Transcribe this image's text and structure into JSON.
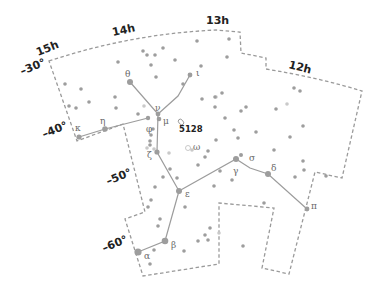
{
  "colors": {
    "boundary": "#9a9a9a",
    "star": "#9d9d9d",
    "line": "#9c9c9c",
    "label": "#222222"
  },
  "ra_labels": [
    {
      "text": "15h",
      "x": 38,
      "y": 56,
      "rot": -22
    },
    {
      "text": "14h",
      "x": 113,
      "y": 36,
      "rot": -12
    },
    {
      "text": "13h",
      "x": 206,
      "y": 24,
      "rot": 0
    },
    {
      "text": "12h",
      "x": 288,
      "y": 68,
      "rot": 14
    }
  ],
  "dec_labels": [
    {
      "text": "–30°",
      "x": 22,
      "y": 75,
      "rot": -22
    },
    {
      "text": "–40°",
      "x": 44,
      "y": 138,
      "rot": -22
    },
    {
      "text": "–50°",
      "x": 108,
      "y": 185,
      "rot": -22
    },
    {
      "text": "–60°",
      "x": 104,
      "y": 252,
      "rot": -22
    }
  ],
  "named_stars": [
    {
      "greek": "α",
      "x": 138,
      "y": 252,
      "r": 3.6,
      "lx": 144,
      "ly": 256
    },
    {
      "greek": "β",
      "x": 165,
      "y": 241,
      "r": 3.3,
      "lx": 171,
      "ly": 245
    },
    {
      "greek": "γ",
      "x": 236,
      "y": 159,
      "r": 3.0,
      "lx": 233,
      "ly": 171
    },
    {
      "greek": "δ",
      "x": 268,
      "y": 174,
      "r": 3.0,
      "lx": 271,
      "ly": 168
    },
    {
      "greek": "ε",
      "x": 179,
      "y": 191,
      "r": 3.0,
      "lx": 185,
      "ly": 194
    },
    {
      "greek": "ζ",
      "x": 157,
      "y": 152,
      "r": 2.6,
      "lx": 147,
      "ly": 155
    },
    {
      "greek": "η",
      "x": 105,
      "y": 129,
      "r": 2.8,
      "lx": 100,
      "ly": 121
    },
    {
      "greek": "θ",
      "x": 130,
      "y": 82,
      "r": 3.0,
      "lx": 125,
      "ly": 74
    },
    {
      "greek": "ι",
      "x": 190,
      "y": 75,
      "r": 2.4,
      "lx": 196,
      "ly": 73
    },
    {
      "greek": "κ",
      "x": 79,
      "y": 137,
      "r": 2.6,
      "lx": 75,
      "ly": 128
    },
    {
      "greek": "μ",
      "x": 159,
      "y": 119,
      "r": 2.3,
      "lx": 163,
      "ly": 121
    },
    {
      "greek": "ν",
      "x": 158,
      "y": 114,
      "r": 2.4,
      "lx": 155,
      "ly": 108
    },
    {
      "greek": "π",
      "x": 307,
      "y": 209,
      "r": 2.4,
      "lx": 311,
      "ly": 206
    },
    {
      "greek": "σ",
      "x": 241,
      "y": 155,
      "r": 2.0,
      "lx": 249,
      "ly": 158
    },
    {
      "greek": "φ",
      "x": 148,
      "y": 118,
      "r": 2.2,
      "lx": 146,
      "ly": 129
    },
    {
      "greek": "ω",
      "x": 188,
      "y": 148,
      "r": 0,
      "lx": 193,
      "ly": 147
    }
  ],
  "deep_sky": [
    {
      "label": "5128",
      "x": 181,
      "y": 130,
      "lx": 179,
      "ly": 129
    }
  ],
  "stick_lines": [
    [
      [
        130,
        82
      ],
      [
        158,
        114
      ],
      [
        157,
        152
      ],
      [
        179,
        191
      ],
      [
        165,
        241
      ],
      [
        138,
        252
      ]
    ],
    [
      [
        158,
        114
      ],
      [
        178,
        96
      ],
      [
        190,
        75
      ]
    ],
    [
      [
        79,
        137
      ],
      [
        105,
        129
      ],
      [
        148,
        118
      ]
    ],
    [
      [
        179,
        191
      ],
      [
        236,
        159
      ],
      [
        250,
        168
      ],
      [
        268,
        174
      ],
      [
        307,
        209
      ]
    ]
  ],
  "boundary_path": "M49,61 Q130,34 216,30 L240,32 L241,53 L266,58 L266,69 Q320,78 362,91 L342,178 L315,172 L289,274 L262,268 L274,208 L219,203 L219,264 L143,276 L125,219 L145,212 L123,124 L77,141 L49,61 Z",
  "small_stars": [
    [
      143,
      51
    ],
    [
      147,
      55
    ],
    [
      155,
      55
    ],
    [
      151,
      65
    ],
    [
      156,
      77
    ],
    [
      163,
      48
    ],
    [
      197,
      41
    ],
    [
      229,
      39
    ],
    [
      227,
      57
    ],
    [
      201,
      66
    ],
    [
      183,
      84
    ],
    [
      202,
      99
    ],
    [
      215,
      97
    ],
    [
      222,
      93
    ],
    [
      215,
      107
    ],
    [
      241,
      111
    ],
    [
      246,
      107
    ],
    [
      225,
      118
    ],
    [
      234,
      130
    ],
    [
      216,
      140
    ],
    [
      238,
      138
    ],
    [
      256,
      132
    ],
    [
      276,
      109
    ],
    [
      303,
      126
    ],
    [
      294,
      88
    ],
    [
      300,
      91
    ],
    [
      290,
      137
    ],
    [
      205,
      157
    ],
    [
      208,
      151
    ],
    [
      198,
      165
    ],
    [
      220,
      171
    ],
    [
      170,
      169
    ],
    [
      177,
      178
    ],
    [
      163,
      177
    ],
    [
      185,
      207
    ],
    [
      214,
      186
    ],
    [
      232,
      180
    ],
    [
      274,
      150
    ],
    [
      303,
      161
    ],
    [
      304,
      170
    ],
    [
      326,
      176
    ],
    [
      295,
      177
    ],
    [
      264,
      203
    ],
    [
      210,
      228
    ],
    [
      205,
      235
    ],
    [
      198,
      241
    ],
    [
      208,
      240
    ],
    [
      243,
      246
    ],
    [
      184,
      251
    ],
    [
      154,
      250
    ],
    [
      150,
      264
    ],
    [
      160,
      219
    ],
    [
      158,
      226
    ],
    [
      148,
      207
    ],
    [
      151,
      200
    ],
    [
      155,
      187
    ],
    [
      151,
      135
    ],
    [
      150,
      141
    ],
    [
      153,
      129
    ],
    [
      138,
      114
    ],
    [
      115,
      97
    ],
    [
      116,
      108
    ],
    [
      89,
      102
    ],
    [
      76,
      108
    ],
    [
      81,
      89
    ],
    [
      65,
      84
    ],
    [
      69,
      106
    ],
    [
      150,
      145
    ],
    [
      118,
      62
    ],
    [
      175,
      60
    ]
  ],
  "faint_stars": [
    [
      144,
      106
    ],
    [
      216,
      97
    ],
    [
      287,
      104
    ],
    [
      169,
      153
    ],
    [
      219,
      233
    ],
    [
      147,
      148
    ],
    [
      154,
      149
    ],
    [
      192,
      150
    ]
  ]
}
